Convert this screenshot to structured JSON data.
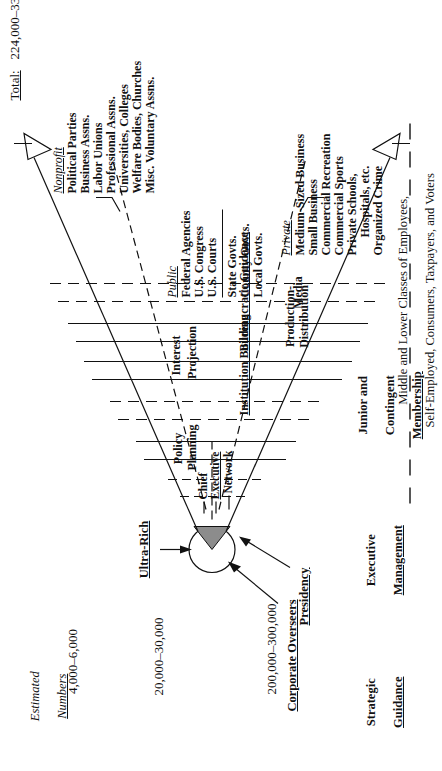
{
  "figure": {
    "type": "power-structure-pyramid",
    "orientation": "rotated-90-ccw-on-page"
  },
  "right_column": {
    "header_line1": "Estimated",
    "header_line2": "Numbers",
    "values": [
      "4,000–6,000",
      "20,000–30,000",
      "200,000–300,000"
    ],
    "total_label": "Total:",
    "total_value": "224,000–336,000 *"
  },
  "left_column": {
    "tiers": [
      {
        "line1": "Strategic",
        "line2": "Guidance"
      },
      {
        "line1": "Executive",
        "line2": "Management"
      },
      {
        "line1": "Junior and",
        "line2": "Contingent",
        "line3": "Membership"
      }
    ]
  },
  "apex": {
    "ultra_rich": "Ultra-Rich",
    "corporate_overseers": "Corporate Overseers",
    "presidency": "Presidency",
    "chief_executive_network": [
      "Chief",
      "Executive",
      "Network"
    ]
  },
  "band_labels": {
    "policy_planning": [
      "Policy",
      "Planning"
    ],
    "interest_projection": [
      "Interest",
      "Projection"
    ],
    "institution_building": "Institution Building",
    "bureaucratic_guidance": "Bureaucratic Guidance",
    "production_distribution": [
      "Production-",
      "Distribution"
    ],
    "media": "Media"
  },
  "sectors": {
    "nonprofit": {
      "heading": "Nonprofit",
      "items": [
        "Political Parties",
        "Business Assns.",
        "Labor Unions",
        "Professional Assns.",
        "Universities, Colleges",
        "Welfare Bodies, Churches",
        "Misc. Voluntary Assns."
      ]
    },
    "public": {
      "heading": "Public",
      "items_upper": [
        "Federal Agencies",
        "U.S. Congress",
        "U.S. Courts"
      ],
      "items_lower": [
        "State Govts.",
        "County Govts.",
        "Local Govts."
      ]
    },
    "private": {
      "heading": "Private",
      "items": [
        "Medium-Sized Business",
        "Small Business",
        "Commercial Recreation",
        "Commercial Sports",
        "Private Schools,",
        "Hospitals, etc.",
        "Organized Crime"
      ]
    }
  },
  "base": {
    "line1": "Middle and Lower Classes of Employees,",
    "line2": "Self-Employed, Consumers, Taxpayers, and Voters"
  },
  "colors": {
    "ink": "#111111",
    "apex_fill": "#8c8c8c",
    "paper": "#ffffff"
  }
}
